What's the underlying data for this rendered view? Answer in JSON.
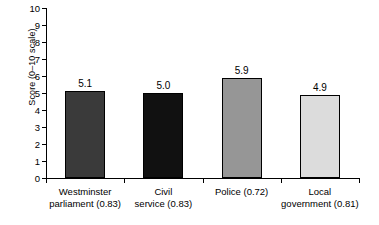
{
  "chart_data": {
    "type": "bar",
    "title": "",
    "xlabel": "",
    "ylabel": "Score (0–10 scale)",
    "ylim": [
      0,
      10
    ],
    "ytick_labels": [
      "10",
      "9",
      "8",
      "7",
      "6",
      "5",
      "4",
      "3",
      "2",
      "1",
      "0"
    ],
    "yticks": [
      10,
      9,
      8,
      7,
      6,
      5,
      4,
      3,
      2,
      1,
      0
    ],
    "grid": false,
    "legend": false,
    "legend_position": "none",
    "categories": [
      "Westminster\nparliament (0.83)",
      "Civil\nservice (0.83)",
      "Police (0.72)",
      "Local\ngovernment (0.81)"
    ],
    "values": [
      5.1,
      5.0,
      5.9,
      4.9
    ],
    "value_labels": [
      "5.1",
      "5.0",
      "5.9",
      "4.9"
    ],
    "bar_colors": [
      "#3a3a3a",
      "#111111",
      "#969696",
      "#dcdcdc"
    ],
    "bar_edge_color": "#000000"
  }
}
